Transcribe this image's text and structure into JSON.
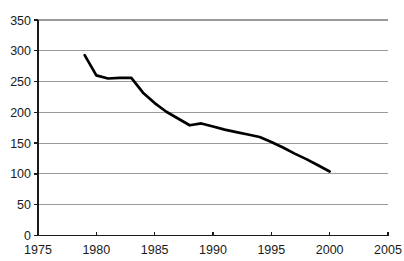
{
  "chart_data": {
    "type": "line",
    "title": "",
    "subtitle": "",
    "xlabel": "",
    "ylabel": "",
    "xlim": [
      1975,
      2005
    ],
    "ylim": [
      0,
      350
    ],
    "grid": true,
    "legend": "none",
    "x_ticks": [
      1975,
      1980,
      1985,
      1990,
      1995,
      2000,
      2005
    ],
    "y_ticks": [
      0,
      50,
      100,
      150,
      200,
      250,
      300,
      350
    ],
    "x_tick_labels": [
      "1975",
      "1980",
      "1985",
      "1990",
      "1995",
      "2000",
      "2005"
    ],
    "y_tick_labels": [
      "0",
      "50",
      "100",
      "150",
      "200",
      "250",
      "300",
      "350"
    ],
    "series": [
      {
        "name": "series-1",
        "color": "#000000",
        "x": [
          1979,
          1980,
          1981,
          1982,
          1983,
          1984,
          1985,
          1986,
          1987,
          1988,
          1989,
          1990,
          1991,
          1992,
          1993,
          1994,
          1995,
          1996,
          1997,
          1998,
          1999,
          2000
        ],
        "values": [
          293,
          260,
          255,
          256,
          256,
          232,
          215,
          201,
          190,
          179,
          182,
          177,
          172,
          168,
          164,
          160,
          152,
          143,
          133,
          124,
          114,
          104
        ]
      }
    ],
    "colors": {
      "line": "#000000",
      "gridline": "#9a9a9a",
      "axis": "#1a1a1a",
      "text": "#1a1a1a",
      "background": "#ffffff"
    }
  },
  "chart_geometry": {
    "plot_left": 38,
    "plot_right": 388,
    "plot_top": 20,
    "plot_bottom": 235.5
  }
}
